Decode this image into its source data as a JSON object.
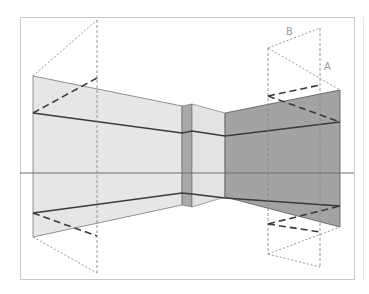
{
  "figure": {
    "labels": {
      "point_a": "A",
      "point_b": "B"
    },
    "colors": {
      "frame": "#c9c9c9",
      "light_wall": "#e6e6e6",
      "pillar_dark": "#a8a8a8",
      "pillar_light": "#e3e3e3",
      "dark_wall": "#a3a3a3",
      "line_dark": "#3a3a3a",
      "guide": "#8a8a8a",
      "horizon": "#6e6e6e"
    }
  }
}
